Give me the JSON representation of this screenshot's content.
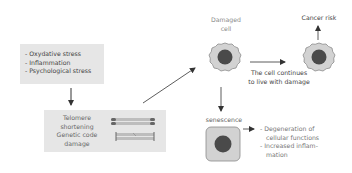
{
  "stressors": {
    "items": [
      "- Oxydative stress",
      "- Inflammation",
      "- Psychological stress"
    ]
  },
  "damage_box": {
    "lines": [
      "Telomere",
      "shortening",
      "Genetic code",
      "damage"
    ]
  },
  "damaged_cell": {
    "label_line1": "Damaged",
    "label_line2": "cell"
  },
  "cancer": {
    "label": "Cancer risk"
  },
  "continue_label": {
    "line1": "The cell continues",
    "line2": "to live with damage"
  },
  "senescence": {
    "label": "senescence",
    "effects": [
      "- Degeneration of",
      "cellular functions",
      "- Increased inflam-",
      "mation"
    ]
  },
  "colors": {
    "box_fill": "#e6e6e6",
    "cell_fill": "#d2d2d2",
    "nucleus": "#4a4a4a",
    "chromosome_dark": "#666666",
    "chromosome_light": "#bdbdbd",
    "arrow": "#333333"
  }
}
